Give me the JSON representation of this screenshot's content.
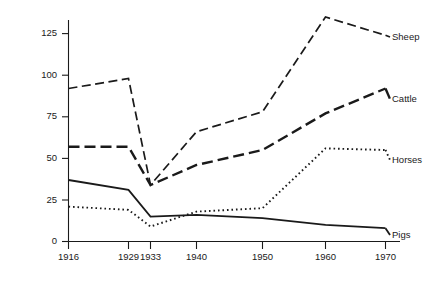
{
  "chart_data": {
    "type": "line",
    "title": "",
    "subtitle": "",
    "xlabel": "",
    "ylabel": "",
    "categories": [
      "1916",
      "1929",
      "1933",
      "1940",
      "1950",
      "1960",
      "1970"
    ],
    "x": [
      1916,
      1929,
      1933,
      1940,
      1950,
      1960,
      1970
    ],
    "xtick_labels": [
      "1916",
      "1929",
      "1933",
      "1940",
      "1950",
      "1960",
      "1970"
    ],
    "ytick_labels": [
      "0",
      "25",
      "50",
      "75",
      "100",
      "125"
    ],
    "yticks": [
      0,
      25,
      50,
      75,
      100,
      125
    ],
    "ylim": [
      0,
      140
    ],
    "xlim": [
      1916,
      1970
    ],
    "grid": false,
    "legend_position": "right-inline-labels",
    "series": [
      {
        "name": "Sheep",
        "style": "dashed",
        "color": "#1a1a1a",
        "values": [
          92,
          98,
          34,
          66,
          78,
          135,
          124
        ]
      },
      {
        "name": "Cattle",
        "style": "dashed-thick",
        "color": "#1a1a1a",
        "values": [
          57,
          57,
          34,
          46,
          55,
          77,
          92
        ]
      },
      {
        "name": "Horses",
        "style": "dotted",
        "color": "#1a1a1a",
        "values": [
          21,
          19,
          9,
          18,
          20,
          56,
          55
        ]
      },
      {
        "name": "Pigs",
        "style": "solid",
        "color": "#1a1a1a",
        "values": [
          37,
          31,
          15,
          16,
          14,
          10,
          8
        ]
      }
    ]
  },
  "labels": {
    "sheep": "Sheep",
    "cattle": "Cattle",
    "horses": "Horses",
    "pigs": "Pigs"
  },
  "yticks": {
    "t0": "0",
    "t1": "25",
    "t2": "50",
    "t3": "75",
    "t4": "100",
    "t5": "125"
  },
  "xticks": {
    "t0": "1916",
    "t1": "1929",
    "t2": "1933",
    "t3": "1940",
    "t4": "1950",
    "t5": "1960",
    "t6": "1970"
  },
  "colors": {
    "ink": "#1a1a1a",
    "background": "#ffffff"
  }
}
